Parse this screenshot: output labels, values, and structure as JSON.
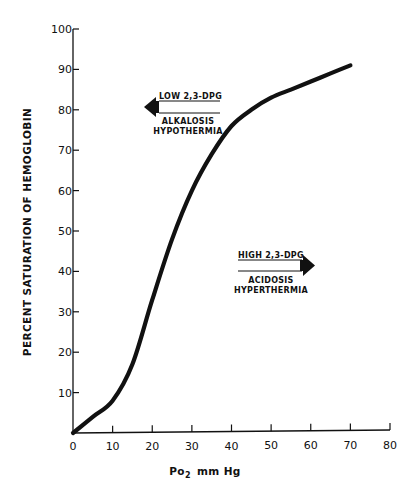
{
  "chart_data": {
    "type": "line",
    "title": "",
    "xlabel": "Po2 mm Hg",
    "xlabel_main": "Po",
    "xlabel_sub": "2",
    "xlabel_unit": "mm Hg",
    "ylabel": "PERCENT SATURATION OF HEMOGLOBIN",
    "xlim": [
      0,
      80
    ],
    "ylim": [
      0,
      100
    ],
    "x_ticks": [
      0,
      10,
      20,
      30,
      40,
      50,
      60,
      70,
      80
    ],
    "x_tick_labels": [
      "0",
      "10",
      "20",
      "30",
      "40",
      "50",
      "60",
      "70",
      "80"
    ],
    "y_ticks": [
      10,
      20,
      30,
      40,
      50,
      60,
      70,
      80,
      90,
      100
    ],
    "y_tick_labels": [
      "10",
      "20",
      "30",
      "40",
      "50",
      "60",
      "70",
      "80",
      "90",
      "100"
    ],
    "grid": false,
    "legend": "none",
    "series": [
      {
        "name": "Oxyhemoglobin dissociation curve",
        "x": [
          0,
          5,
          10,
          15,
          20,
          25,
          30,
          35,
          40,
          45,
          50,
          55,
          60,
          65,
          70
        ],
        "y": [
          0,
          4,
          8,
          17,
          33,
          48,
          60,
          69,
          76,
          80,
          83,
          85,
          87,
          89,
          91
        ]
      }
    ],
    "annotations": [
      {
        "id": "left-shift",
        "direction": "left",
        "line_above": "LOW 2,3-DPG",
        "line_below_1": "ALKALOSIS",
        "line_below_2": "HYPOTHERMIA",
        "approx_position": {
          "x": 7,
          "y": 81
        }
      },
      {
        "id": "right-shift",
        "direction": "right",
        "line_above": "HIGH 2,3-DPG",
        "line_below_1": "ACIDOSIS",
        "line_below_2": "HYPERTHERMIA",
        "approx_position": {
          "x": 42,
          "y": 43
        }
      }
    ]
  },
  "style": {
    "ink_color": "#111111",
    "background_color": "#ffffff"
  }
}
